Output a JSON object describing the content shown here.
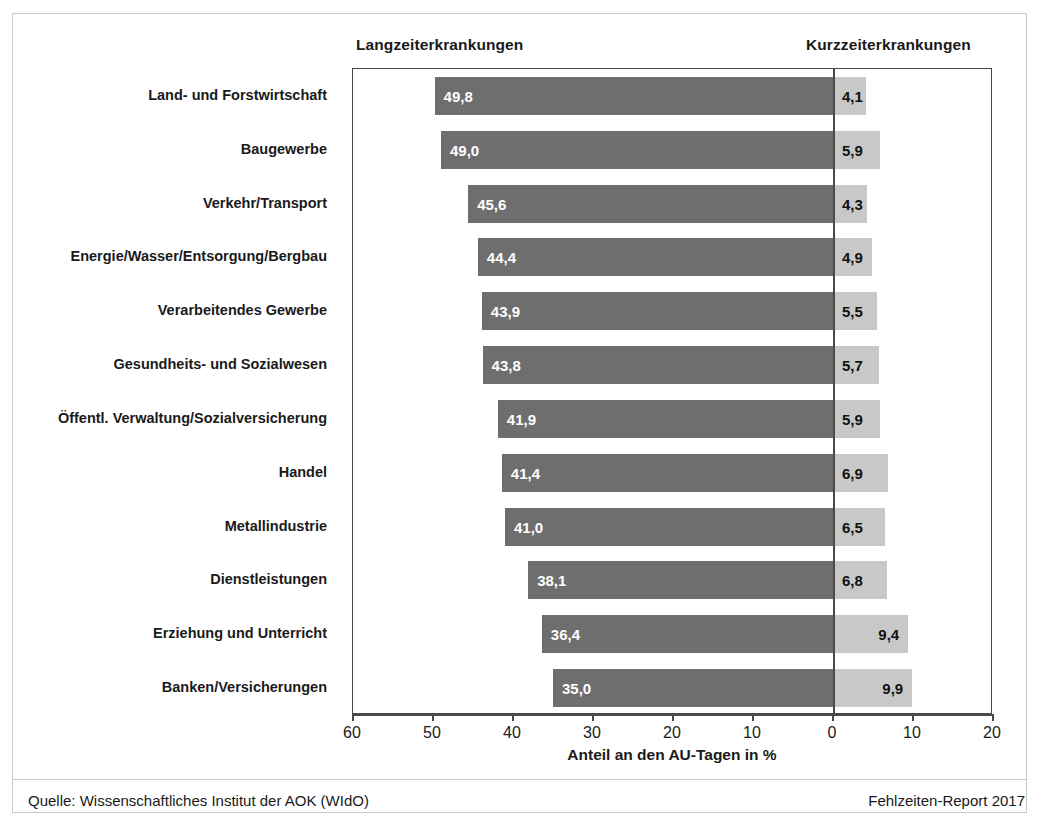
{
  "headers": {
    "left": "Langzeiterkrankungen",
    "right": "Kurzzeiterkrankungen"
  },
  "axis": {
    "title": "Anteil an den AU-Tagen in %",
    "ticks": [
      "60",
      "50",
      "40",
      "30",
      "20",
      "10",
      "0",
      "10",
      "20"
    ]
  },
  "footer": {
    "source": "Quelle: Wissenschaftliches Institut der AOK (WIdO)",
    "report": "Fehlzeiten-Report 2017"
  },
  "colors": {
    "bar_left": "#6e6e6e",
    "bar_right": "#c8c8c8",
    "frame": "#4a4a4a",
    "text": "#1a1a1a"
  },
  "chart_data": {
    "type": "bar",
    "orientation": "horizontal-diverging",
    "title": "",
    "xlabel": "Anteil an den AU-Tagen in %",
    "ylabel": "",
    "xlim": [
      -60,
      20
    ],
    "xticks": [
      60,
      50,
      40,
      30,
      20,
      10,
      0,
      10,
      20
    ],
    "grid": false,
    "legend_position": "top",
    "categories": [
      "Land- und Forstwirtschaft",
      "Baugewerbe",
      "Verkehr/Transport",
      "Energie/Wasser/Entsorgung/Bergbau",
      "Verarbeitendes Gewerbe",
      "Gesundheits- und Sozialwesen",
      "Öffentl. Verwaltung/Sozialversicherung",
      "Handel",
      "Metallindustrie",
      "Dienstleistungen",
      "Erziehung und Unterricht",
      "Banken/Versicherungen"
    ],
    "series": [
      {
        "name": "Langzeiterkrankungen",
        "side": "left",
        "color": "#6e6e6e",
        "values": [
          49.8,
          49.0,
          45.6,
          44.4,
          43.9,
          43.8,
          41.9,
          41.4,
          41.0,
          38.1,
          36.4,
          35.0
        ],
        "labels": [
          "49,8",
          "49,0",
          "45,6",
          "44,4",
          "43,9",
          "43,8",
          "41,9",
          "41,4",
          "41,0",
          "38,1",
          "36,4",
          "35,0"
        ]
      },
      {
        "name": "Kurzzeiterkrankungen",
        "side": "right",
        "color": "#c8c8c8",
        "values": [
          4.1,
          5.9,
          4.3,
          4.9,
          5.5,
          5.7,
          5.9,
          6.9,
          6.5,
          6.8,
          9.4,
          9.9
        ],
        "labels": [
          "4,1",
          "5,9",
          "4,3",
          "4,9",
          "5,5",
          "5,7",
          "5,9",
          "6,9",
          "6,5",
          "6,8",
          "9,4",
          "9,9"
        ]
      }
    ]
  }
}
